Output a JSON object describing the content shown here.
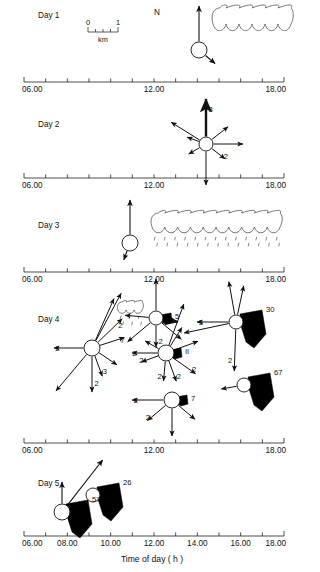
{
  "figure": {
    "x_axis_title": "Time of day ( h )",
    "north_label": "N",
    "scalebar": {
      "min": "0",
      "max": "1",
      "unit": "km"
    }
  },
  "axis": {
    "start_hour": 6,
    "end_hour": 18,
    "tick_interval_hours": 1,
    "end_labels": [
      "06.00",
      "12.00",
      "18.00"
    ],
    "full_labels": [
      "06.00",
      "08.00",
      "10.00",
      "12.00",
      "14.00",
      "16.00",
      "18.00"
    ],
    "full_label_hours": [
      6,
      8,
      10,
      12,
      14,
      16,
      18
    ]
  },
  "panels": [
    {
      "id": "day1",
      "label": "Day 1",
      "axis_labels": [
        "06.00",
        "12.00",
        "18.00"
      ],
      "nodes": [
        {
          "x": 199,
          "y": 50,
          "r": 8,
          "wedge": null,
          "wedge_value": null,
          "vectors": [
            {
              "angle": 90,
              "len": 36,
              "width": 1.1,
              "label": null
            },
            {
              "angle": -40,
              "len": 13,
              "width": 1.1,
              "label": null
            }
          ]
        }
      ],
      "clouds": [
        {
          "x": 213,
          "y": 8,
          "w": 78,
          "h": 16,
          "rain": false
        }
      ]
    },
    {
      "id": "day2",
      "label": "Day 2",
      "axis_labels": [
        "06.00",
        "12.00",
        "18.00"
      ],
      "nodes": [
        {
          "x": 206,
          "y": 144,
          "r": 7,
          "wedge": null,
          "wedge_value": null,
          "vectors": [
            {
              "angle": 90,
              "len": 38,
              "width": 2.4,
              "label": "3"
            },
            {
              "angle": 38,
              "len": 21,
              "width": 1.0,
              "label": null
            },
            {
              "angle": 0,
              "len": 30,
              "width": 1.0,
              "label": null
            },
            {
              "angle": -38,
              "len": 17,
              "width": 1.0,
              "label": "2"
            },
            {
              "angle": -90,
              "len": 34,
              "width": 1.0,
              "label": null
            },
            {
              "angle": -150,
              "len": 13,
              "width": 1.0,
              "label": null
            },
            {
              "angle": 160,
              "len": 13,
              "width": 1.0,
              "label": null
            },
            {
              "angle": 148,
              "len": 34,
              "width": 1.0,
              "label": null
            }
          ]
        }
      ],
      "clouds": []
    },
    {
      "id": "day3",
      "label": "Day 3",
      "axis_labels": [
        "06.00",
        "12.00",
        "18.00"
      ],
      "nodes": [
        {
          "x": 130,
          "y": 243,
          "r": 8,
          "wedge": null,
          "wedge_value": null,
          "vectors": [
            {
              "angle": 90,
              "len": 35,
              "width": 1.1,
              "label": null
            },
            {
              "angle": -110,
              "len": 10,
              "width": 1.1,
              "label": null
            }
          ]
        }
      ],
      "clouds": [
        {
          "x": 152,
          "y": 213,
          "w": 128,
          "h": 14,
          "rain": true
        }
      ]
    },
    {
      "id": "day4",
      "label": "Day 4",
      "axis_labels": [
        "06.00",
        "12.00",
        "18.00"
      ],
      "nodes": [
        {
          "x": 92,
          "y": 348,
          "r": 8,
          "wedge": null,
          "wedge_value": null,
          "vectors": [
            {
              "angle": 62,
              "len": 54,
              "width": 1.0,
              "label": null
            },
            {
              "angle": 66,
              "len": 46,
              "width": 1.0,
              "label": null
            },
            {
              "angle": 44,
              "len": 34,
              "width": 1.0,
              "label": "2"
            },
            {
              "angle": 18,
              "len": 26,
              "width": 1.0,
              "label": "7"
            },
            {
              "angle": -34,
              "len": 22,
              "width": 1.0,
              "label": null
            },
            {
              "angle": -70,
              "len": 22,
              "width": 1.0,
              "label": "3"
            },
            {
              "angle": -90,
              "len": 36,
              "width": 1.0,
              "label": "2"
            },
            {
              "angle": -130,
              "len": 48,
              "width": 1.0,
              "label": null
            },
            {
              "angle": 180,
              "len": 30,
              "width": 1.0,
              "label": "2"
            }
          ]
        },
        {
          "x": 156,
          "y": 318,
          "r": 7,
          "wedge": "small",
          "wedge_value": "5",
          "vectors": [
            {
              "angle": 90,
              "len": 32,
              "width": 1.0,
              "label": null
            },
            {
              "angle": -10,
              "len": 15,
              "width": 2.2,
              "label": null
            },
            {
              "angle": -40,
              "len": 26,
              "width": 1.0,
              "label": null
            },
            {
              "angle": -90,
              "len": 22,
              "width": 1.0,
              "label": "2"
            },
            {
              "angle": -140,
              "len": 30,
              "width": 1.0,
              "label": null
            },
            {
              "angle": 175,
              "len": 24,
              "width": 1.0,
              "label": null
            }
          ]
        },
        {
          "x": 166,
          "y": 353,
          "r": 8,
          "wedge": "small",
          "wedge_value": "II",
          "vectors": [
            {
              "angle": 70,
              "len": 44,
              "width": 1.0,
              "label": null
            },
            {
              "angle": 58,
              "len": 22,
              "width": 1.0,
              "label": null
            },
            {
              "angle": 20,
              "len": 26,
              "width": 1.0,
              "label": null
            },
            {
              "angle": -35,
              "len": 28,
              "width": 1.0,
              "label": "2"
            },
            {
              "angle": -70,
              "len": 22,
              "width": 1.0,
              "label": "2"
            },
            {
              "angle": -95,
              "len": 20,
              "width": 1.0,
              "label": "2"
            },
            {
              "angle": -160,
              "len": 18,
              "width": 1.0,
              "label": "2"
            },
            {
              "angle": 180,
              "len": 26,
              "width": 1.0,
              "label": "2"
            },
            {
              "angle": 150,
              "len": 16,
              "width": 1.0,
              "label": null
            }
          ]
        },
        {
          "x": 236,
          "y": 322,
          "r": 7,
          "wedge": "large",
          "wedge_value": "30",
          "vectors": [
            {
              "angle": 100,
              "len": 34,
              "width": 1.0,
              "label": null
            },
            {
              "angle": 78,
              "len": 30,
              "width": 1.0,
              "label": null
            },
            {
              "angle": 180,
              "len": 32,
              "width": 1.0,
              "label": "3"
            },
            {
              "angle": -92,
              "len": 42,
              "width": 1.0,
              "label": "2"
            },
            {
              "angle": -168,
              "len": 46,
              "width": 1.0,
              "label": null
            }
          ]
        },
        {
          "x": 244,
          "y": 385,
          "r": 7,
          "wedge": "large",
          "wedge_value": "67",
          "vectors": [
            {
              "angle": -170,
              "len": 16,
              "width": 1.0,
              "label": null
            }
          ]
        },
        {
          "x": 172,
          "y": 400,
          "r": 8,
          "wedge": "small",
          "wedge_value": "7",
          "vectors": [
            {
              "angle": 180,
              "len": 32,
              "width": 1.0,
              "label": "2"
            },
            {
              "angle": -40,
              "len": 22,
              "width": 1.0,
              "label": null
            },
            {
              "angle": -90,
              "len": 28,
              "width": 1.0,
              "label": null
            },
            {
              "angle": -140,
              "len": 24,
              "width": 1.0,
              "label": "2"
            }
          ]
        }
      ],
      "clouds": [
        {
          "x": 118,
          "y": 302,
          "w": 24,
          "h": 8,
          "rain": true
        }
      ]
    },
    {
      "id": "day5",
      "label": "Day 5",
      "axis_labels": [
        "06.00",
        "12.00",
        "18.00"
      ],
      "nodes": [
        {
          "x": 62,
          "y": 512,
          "r": 8,
          "wedge": "large",
          "wedge_value": "57",
          "vectors": [
            {
              "angle": 90,
              "len": 22,
              "width": 1.1,
              "label": null
            },
            {
              "angle": 52,
              "len": 58,
              "width": 1.1,
              "label": null
            }
          ]
        },
        {
          "x": 93,
          "y": 495,
          "r": 7,
          "wedge": "large",
          "wedge_value": "26",
          "vectors": []
        }
      ],
      "clouds": []
    }
  ]
}
